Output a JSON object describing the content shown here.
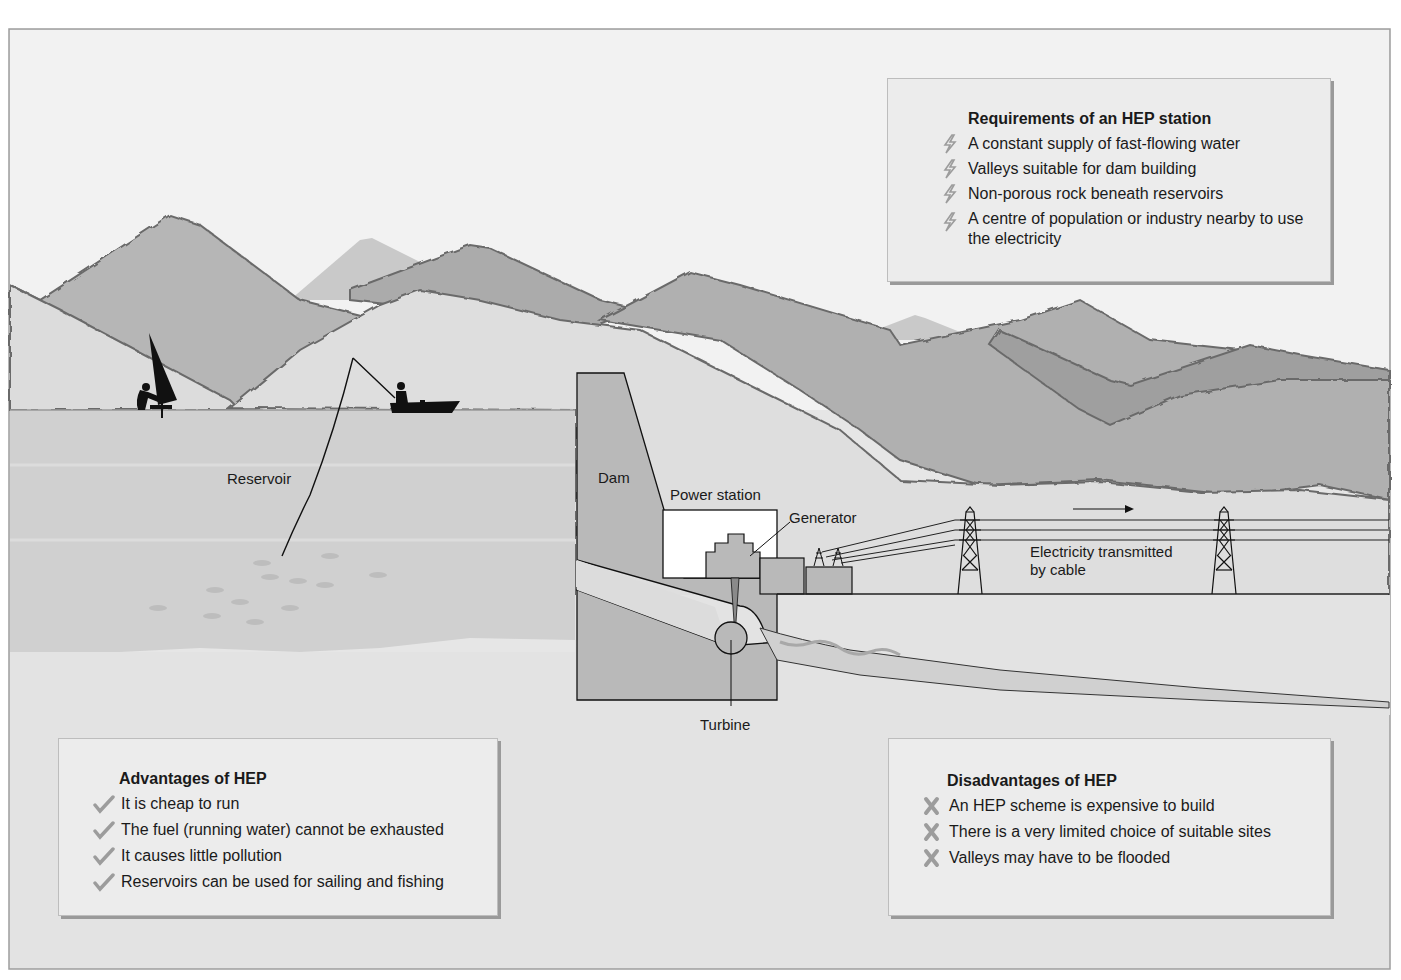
{
  "diagram": {
    "labels": {
      "reservoir": "Reservoir",
      "dam": "Dam",
      "power_station": "Power station",
      "generator": "Generator",
      "turbine": "Turbine",
      "electricity_line1": "Electricity transmitted",
      "electricity_line2": "by cable"
    },
    "colors": {
      "page_bg": "#e6e6e6",
      "sky": "#f2f2f2",
      "mountain_far": "#c4c4c4",
      "mountain_mid": "#b3b3b3",
      "mountain_dark": "#a3a3a3",
      "hillside": "#dcdcdc",
      "water": "#d2d2d2",
      "structure": "#b9b9b9",
      "ink": "#111111",
      "panel_bg": "#ececec",
      "bullet_grey": "#9c9c9c"
    }
  },
  "requirements": {
    "title": "Requirements of an HEP station",
    "icon": "lightning-bolt-icon",
    "items": [
      "A constant supply of fast-flowing water",
      "Valleys suitable for dam building",
      "Non-porous rock beneath reservoirs",
      "A centre of population or industry nearby to use the electricity"
    ]
  },
  "advantages": {
    "title": "Advantages of HEP",
    "icon": "checkmark-icon",
    "items": [
      "It is cheap to run",
      "The fuel (running water) cannot be exhausted",
      "It causes little pollution",
      "Reservoirs can be used for sailing and fishing"
    ]
  },
  "disadvantages": {
    "title": "Disadvantages of HEP",
    "icon": "cross-icon",
    "items": [
      "An HEP scheme is expensive to build",
      "There is a very limited choice of suitable sites",
      "Valleys may have to be flooded"
    ]
  }
}
